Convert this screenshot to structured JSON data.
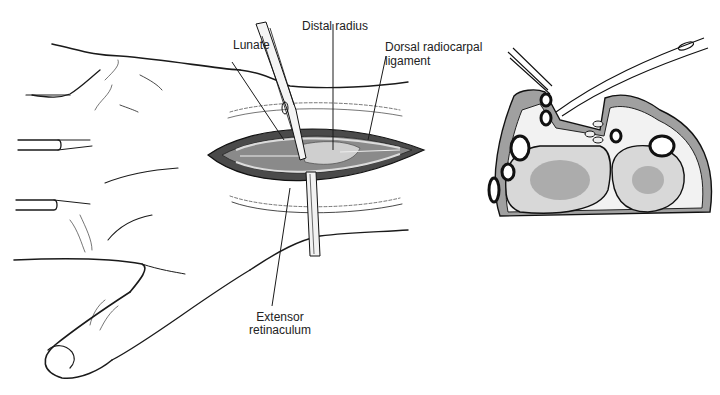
{
  "figure": {
    "labels": {
      "lunate": "Lunate",
      "distal_radius": "Distal radius",
      "dorsal_radiocarpal_ligament_line1": "Dorsal radiocarpal",
      "dorsal_radiocarpal_ligament_line2": "ligament",
      "extensor_retinaculum_line1": "Extensor",
      "extensor_retinaculum_line2": "retinaculum"
    },
    "panels": [
      {
        "name": "hand-dorsal-view"
      },
      {
        "name": "wrist-cross-section"
      }
    ],
    "colors": {
      "line": "#1a1a1a",
      "muscle": "#9a9a9a",
      "bone": "#e6e6e6",
      "background": "#ffffff"
    }
  }
}
